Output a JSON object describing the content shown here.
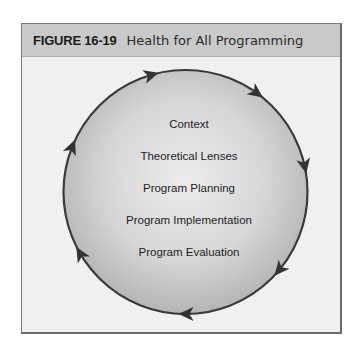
{
  "figure": {
    "label": "FIGURE 16-19",
    "title": "Health for All Programming"
  },
  "diagram": {
    "type": "cycle",
    "direction": "clockwise",
    "arrow_count": 7,
    "stages": [
      "Context",
      "Theoretical Lenses",
      "Program Planning",
      "Program Implementation",
      "Program Evaluation"
    ]
  },
  "colors": {
    "header_bg": "#c9c9c9",
    "box_bg": "#f0f0f0",
    "circle_stroke": "#3a3a3a",
    "circle_fill_center": "#ebebeb",
    "circle_fill_edge": "#b9b9b9"
  }
}
